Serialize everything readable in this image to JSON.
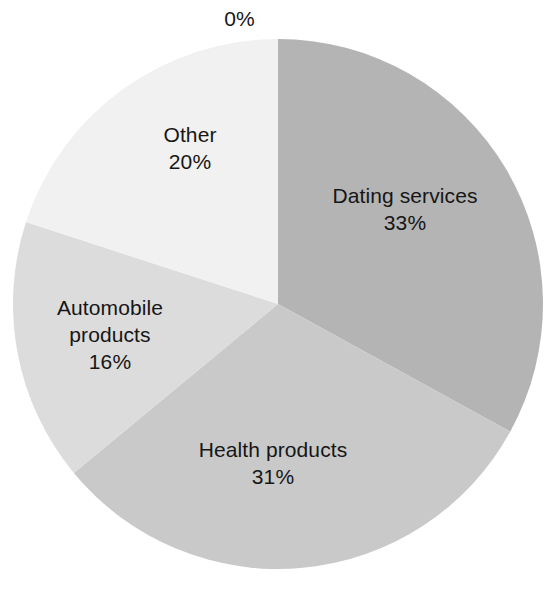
{
  "chart_data": {
    "type": "pie",
    "title": "",
    "subtitle": "",
    "xlabel": "",
    "ylabel": "",
    "legend_position": "none",
    "grid": false,
    "units": "percent",
    "start_angle_deg": 0,
    "direction": "clockwise",
    "categories": [
      "Dating services",
      "Health products",
      "Automobile products",
      "Other"
    ],
    "values": [
      33,
      31,
      16,
      20
    ],
    "slices": [
      {
        "label": "Dating services",
        "value": 33,
        "value_text": "33%",
        "color": "#b4b4b4",
        "start_deg": 0,
        "end_deg": 118.8
      },
      {
        "label": "Health products",
        "value": 31,
        "value_text": "31%",
        "color": "#c9c9c9",
        "start_deg": 118.8,
        "end_deg": 230.4
      },
      {
        "label": "Automobile products",
        "value": 16,
        "value_text": "16%",
        "color": "#dcdcdc",
        "start_deg": 230.4,
        "end_deg": 288.0
      },
      {
        "label": "Other",
        "value": 20,
        "value_text": "20%",
        "color": "#f1f1f1",
        "start_deg": 288.0,
        "end_deg": 360.0
      }
    ],
    "annotations": [
      {
        "name": "zero-percent",
        "text": "0%",
        "value": 0,
        "position": "top"
      }
    ]
  },
  "labels": {
    "zero": {
      "value_text": "0%"
    },
    "dating": {
      "name": "Dating services",
      "value_text": "33%"
    },
    "health": {
      "name": "Health products",
      "value_text": "31%"
    },
    "automobile": {
      "name_line1": "Automobile",
      "name_line2": "products",
      "value_text": "16%"
    },
    "other": {
      "name": "Other",
      "value_text": "20%"
    }
  },
  "geometry": {
    "center_x": 278,
    "center_y": 304,
    "radius": 265
  },
  "colors": {
    "background": "#ffffff",
    "text": "#161616",
    "slice_dating": "#b4b4b4",
    "slice_health": "#c9c9c9",
    "slice_automobile": "#dcdcdc",
    "slice_other": "#f1f1f1"
  }
}
